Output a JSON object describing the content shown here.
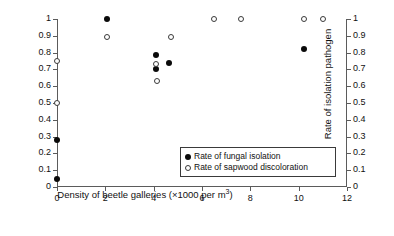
{
  "chart_data": {
    "type": "scatter",
    "title": "",
    "xlabel": "Density of beetle galleries (×1000 per m³)",
    "xlabel_base": "Density of beetle galleries (×1000 per m",
    "xlabel_sup": "3",
    "xlabel_tail": ")",
    "ylabel": "Rate of sapwood discoloration",
    "ylabel_right": "Rate of isolation pathogen",
    "xlim": [
      0,
      12
    ],
    "ylim": [
      0,
      1
    ],
    "ylim_right": [
      0,
      1
    ],
    "grid": false,
    "legend_position": "inside-bottom-right",
    "xticks": [
      0,
      2,
      4,
      6,
      8,
      10,
      12
    ],
    "xticklabels": [
      "0",
      "2",
      "4",
      "6",
      "8",
      "10",
      "12"
    ],
    "yticks": [
      0,
      0.1,
      0.2,
      0.3,
      0.4,
      0.5,
      0.6,
      0.7,
      0.8,
      0.9,
      1
    ],
    "yticklabels": [
      "0",
      "0.1",
      "0.2",
      "0.3",
      "0.4",
      "0.5",
      "0.6",
      "0.7",
      "0.8",
      "0.9",
      "1"
    ],
    "yticklabels_right": [
      "0",
      "0.1",
      "0.2",
      "0.3",
      "0.4",
      "0.5",
      "0.6",
      "0.7",
      "0.8",
      "0.9",
      "1"
    ],
    "series": [
      {
        "name": "Rate of fungal isolation",
        "marker": "filled-circle",
        "color": "#0a0a0a",
        "axis": "right",
        "points": [
          {
            "x": 0.0,
            "y": 0.05
          },
          {
            "x": 0.0,
            "y": 0.28
          },
          {
            "x": 2.05,
            "y": 1.0
          },
          {
            "x": 4.1,
            "y": 0.785
          },
          {
            "x": 4.1,
            "y": 0.7
          },
          {
            "x": 4.65,
            "y": 0.74
          },
          {
            "x": 10.2,
            "y": 0.82
          }
        ]
      },
      {
        "name": "Rate of sapwood discoloration",
        "marker": "open-circle",
        "color": "#3a3a3a",
        "axis": "left",
        "points": [
          {
            "x": 0.0,
            "y": 0.5
          },
          {
            "x": 0.0,
            "y": 0.75
          },
          {
            "x": 2.05,
            "y": 0.89
          },
          {
            "x": 4.1,
            "y": 0.735
          },
          {
            "x": 4.15,
            "y": 0.63
          },
          {
            "x": 4.7,
            "y": 0.89
          },
          {
            "x": 6.5,
            "y": 1.0
          },
          {
            "x": 7.6,
            "y": 1.0
          },
          {
            "x": 10.2,
            "y": 1.0
          },
          {
            "x": 11.0,
            "y": 1.0
          }
        ]
      }
    ]
  },
  "legend": {
    "entries": [
      {
        "label": "Rate of fungal isolation",
        "marker": "filled-circle"
      },
      {
        "label": "Rate of sapwood discoloration",
        "marker": "open-circle"
      }
    ]
  }
}
